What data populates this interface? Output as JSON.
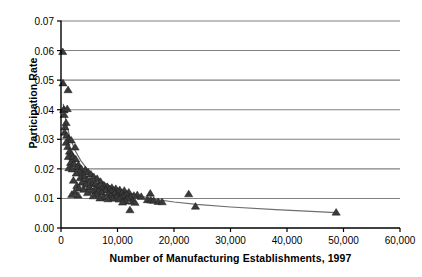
{
  "chart_data": {
    "type": "scatter",
    "title": "",
    "xlabel": "Number of Manufacturing Establishments, 1997",
    "ylabel": "Participation Rate",
    "xlim": [
      0,
      60000
    ],
    "ylim": [
      0,
      0.07
    ],
    "xticks": [
      0,
      10000,
      20000,
      30000,
      40000,
      50000,
      60000
    ],
    "xticklabels": [
      "0",
      "10,000",
      "20,000",
      "30,000",
      "40,000",
      "50,000",
      "60,000"
    ],
    "yticks": [
      0,
      0.01,
      0.02,
      0.03,
      0.04,
      0.05,
      0.06,
      0.07
    ],
    "yticklabels": [
      "0.00",
      "0.01",
      "0.02",
      "0.03",
      "0.04",
      "0.05",
      "0.06",
      "0.07"
    ],
    "grid": "horizontal",
    "legend": "none",
    "marker": "triangle",
    "marker_color": "#3a3a3a",
    "gridline_color": "#808080",
    "axis_color": "#000000",
    "trendline_color": "#6e6e6e",
    "series": [
      {
        "name": "Participation Rate vs. Establishments",
        "points": [
          [
            300,
            0.0595
          ],
          [
            350,
            0.0489
          ],
          [
            1250,
            0.0466
          ],
          [
            500,
            0.04
          ],
          [
            520,
            0.0398
          ],
          [
            1100,
            0.0402
          ],
          [
            560,
            0.0382
          ],
          [
            900,
            0.0355
          ],
          [
            700,
            0.034
          ],
          [
            620,
            0.0322
          ],
          [
            1000,
            0.0312
          ],
          [
            1400,
            0.03
          ],
          [
            1800,
            0.0296
          ],
          [
            900,
            0.0288
          ],
          [
            1200,
            0.0274
          ],
          [
            2500,
            0.0272
          ],
          [
            1500,
            0.0258
          ],
          [
            1900,
            0.0248
          ],
          [
            1300,
            0.024
          ],
          [
            2100,
            0.0238
          ],
          [
            2600,
            0.0232
          ],
          [
            1700,
            0.022
          ],
          [
            2300,
            0.0216
          ],
          [
            3100,
            0.0212
          ],
          [
            2900,
            0.0205
          ],
          [
            1400,
            0.0202
          ],
          [
            3600,
            0.0199
          ],
          [
            2000,
            0.0198
          ],
          [
            4300,
            0.0196
          ],
          [
            3300,
            0.019
          ],
          [
            4800,
            0.0188
          ],
          [
            2700,
            0.0184
          ],
          [
            5300,
            0.0181
          ],
          [
            3900,
            0.0178
          ],
          [
            4100,
            0.0174
          ],
          [
            5800,
            0.0172
          ],
          [
            3400,
            0.0168
          ],
          [
            6400,
            0.0166
          ],
          [
            4600,
            0.0163
          ],
          [
            2200,
            0.016
          ],
          [
            5100,
            0.0158
          ],
          [
            7000,
            0.0156
          ],
          [
            3700,
            0.0153
          ],
          [
            5600,
            0.015
          ],
          [
            6100,
            0.0148
          ],
          [
            4400,
            0.0146
          ],
          [
            7600,
            0.0144
          ],
          [
            2800,
            0.0142
          ],
          [
            6700,
            0.014
          ],
          [
            8200,
            0.0139
          ],
          [
            5000,
            0.0137
          ],
          [
            9000,
            0.0136
          ],
          [
            3200,
            0.0134
          ],
          [
            7300,
            0.0133
          ],
          [
            9700,
            0.0132
          ],
          [
            6000,
            0.0131
          ],
          [
            8600,
            0.013
          ],
          [
            4000,
            0.0129
          ],
          [
            10400,
            0.0128
          ],
          [
            7900,
            0.0127
          ],
          [
            11200,
            0.0126
          ],
          [
            5400,
            0.0125
          ],
          [
            9300,
            0.0125
          ],
          [
            6600,
            0.0124
          ],
          [
            10100,
            0.0123
          ],
          [
            8900,
            0.0122
          ],
          [
            2400,
            0.0121
          ],
          [
            12000,
            0.012
          ],
          [
            7200,
            0.0119
          ],
          [
            10800,
            0.0118
          ],
          [
            4700,
            0.0118
          ],
          [
            9500,
            0.0117
          ],
          [
            15800,
            0.0116
          ],
          [
            8400,
            0.0115
          ],
          [
            22600,
            0.0114
          ],
          [
            11600,
            0.0113
          ],
          [
            1900,
            0.0112
          ],
          [
            6300,
            0.0112
          ],
          [
            13500,
            0.0111
          ],
          [
            10000,
            0.011
          ],
          [
            3000,
            0.011
          ],
          [
            12900,
            0.0109
          ],
          [
            8800,
            0.0108
          ],
          [
            5700,
            0.0107
          ],
          [
            11000,
            0.0106
          ],
          [
            14200,
            0.0105
          ],
          [
            9900,
            0.0104
          ],
          [
            7500,
            0.0103
          ],
          [
            12300,
            0.0102
          ],
          [
            10600,
            0.0101
          ],
          [
            6900,
            0.01
          ],
          [
            9100,
            0.0099
          ],
          [
            11800,
            0.0098
          ],
          [
            8300,
            0.0097
          ],
          [
            10300,
            0.0096
          ],
          [
            15300,
            0.0094
          ],
          [
            15900,
            0.0093
          ],
          [
            16400,
            0.0092
          ],
          [
            11400,
            0.009
          ],
          [
            12700,
            0.0089
          ],
          [
            17200,
            0.0088
          ],
          [
            17900,
            0.0087
          ],
          [
            10900,
            0.0086
          ],
          [
            13100,
            0.0085
          ],
          [
            23800,
            0.0072
          ],
          [
            12200,
            0.006
          ],
          [
            48700,
            0.0052
          ]
        ]
      }
    ],
    "trendline": {
      "description": "fitted declining curve",
      "points": [
        [
          400,
          0.042
        ],
        [
          900,
          0.036
        ],
        [
          1600,
          0.0305
        ],
        [
          2500,
          0.0262
        ],
        [
          3500,
          0.0228
        ],
        [
          4600,
          0.02
        ],
        [
          5800,
          0.0178
        ],
        [
          7200,
          0.0158
        ],
        [
          8700,
          0.0142
        ],
        [
          10400,
          0.0128
        ],
        [
          12300,
          0.0117
        ],
        [
          14500,
          0.0106
        ],
        [
          17000,
          0.0096
        ],
        [
          20000,
          0.0088
        ],
        [
          24000,
          0.008
        ],
        [
          30000,
          0.0071
        ],
        [
          38000,
          0.0062
        ],
        [
          48700,
          0.0052
        ]
      ]
    }
  },
  "axes": {
    "y_title": "Participation Rate",
    "x_title": "Number of Manufacturing Establishments, 1997"
  }
}
